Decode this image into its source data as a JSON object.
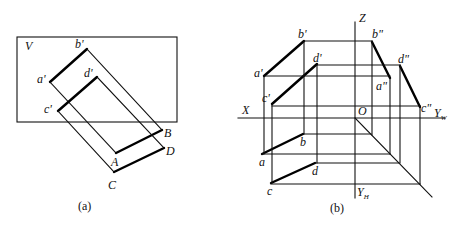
{
  "figure_a": {
    "caption": "(a)",
    "plane_label": "V",
    "labels": {
      "a_prime": "a'",
      "b_prime": "b'",
      "c_prime": "c'",
      "d_prime": "d'",
      "A": "A",
      "B": "B",
      "C": "C",
      "D": "D"
    }
  },
  "figure_b": {
    "caption": "(b)",
    "axes": {
      "X": "X",
      "Z": "Z",
      "O": "O",
      "Yw": "Y",
      "Yw_sub": "W",
      "Yh": "Y",
      "Yh_sub": "H"
    },
    "labels": {
      "a_prime": "a'",
      "b_prime": "b'",
      "c_prime": "c'",
      "d_prime": "d'",
      "a_dprime": "a\"",
      "b_dprime": "b\"",
      "c_dprime": "c\"",
      "d_dprime": "d\"",
      "a": "a",
      "b": "b",
      "c": "c",
      "d": "d"
    }
  },
  "colors": {
    "line": "#111111",
    "background": "#ffffff"
  }
}
